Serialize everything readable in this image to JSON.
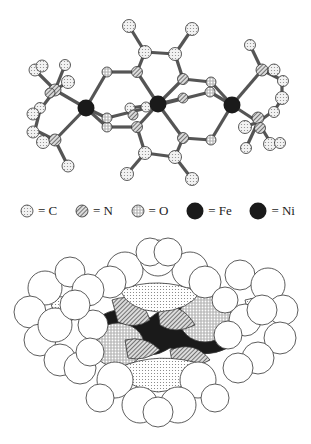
{
  "figure": {
    "top_panel": "ball-and-stick model",
    "bottom_panel": "space-filling model"
  },
  "legend": {
    "items": [
      {
        "symbol": "C",
        "label": "= C",
        "style": "dotted-light"
      },
      {
        "symbol": "N",
        "label": "= N",
        "style": "hatched"
      },
      {
        "symbol": "O",
        "label": "= O",
        "style": "dotted-dense"
      },
      {
        "symbol": "Fe",
        "label": "= Fe",
        "style": "solid-black"
      },
      {
        "symbol": "Ni",
        "label": "= Ni",
        "style": "solid-black"
      }
    ]
  },
  "colors": {
    "carbon_fill": "#e4e4e4",
    "nitrogen_fill": "#9a9a9a",
    "oxygen_fill": "#c8c8c8",
    "metal_fill": "#1a1a1a",
    "outline": "#333333"
  }
}
